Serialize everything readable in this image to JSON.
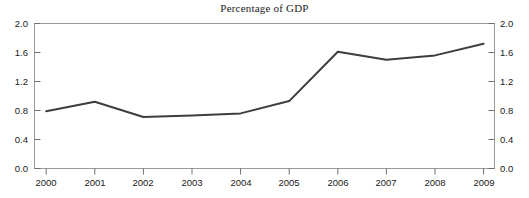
{
  "chart_data": {
    "type": "line",
    "title": "Percentage of GDP",
    "xlabel": "",
    "ylabel": "",
    "categories": [
      "2000",
      "2001",
      "2002",
      "2003",
      "2004",
      "2005",
      "2006",
      "2007",
      "2008",
      "2009"
    ],
    "x": [
      2000,
      2001,
      2002,
      2003,
      2004,
      2005,
      2006,
      2007,
      2008,
      2009
    ],
    "values": [
      0.79,
      0.92,
      0.71,
      0.73,
      0.76,
      0.93,
      1.61,
      1.5,
      1.56,
      1.72
    ],
    "series": [
      {
        "name": "Percentage of GDP",
        "values": [
          0.79,
          0.92,
          0.71,
          0.73,
          0.76,
          0.93,
          1.61,
          1.5,
          1.56,
          1.72
        ]
      }
    ],
    "ylim": [
      0.0,
      2.0
    ],
    "ytick_values": [
      0.0,
      0.4,
      0.8,
      1.2,
      1.6,
      2.0
    ],
    "ytick_labels_left": [
      "0.0",
      "0.4",
      "0.8",
      "1.2",
      "1.6",
      "2.0"
    ],
    "ytick_labels_right": [
      "0.0",
      "0.4",
      "0.8",
      "1.2",
      "1.6",
      "2.0"
    ],
    "xtick_labels": [
      "2000",
      "2001",
      "2002",
      "2003",
      "2004",
      "2005",
      "2006",
      "2007",
      "2008",
      "2009"
    ],
    "grid": false,
    "legend": "none",
    "dual_y_axis": true,
    "line_color": "#3d3d3d",
    "axis_color": "#9a9a9a",
    "background_color": "#ffffff"
  },
  "axes": {
    "y_left": {
      "t0": "0.0",
      "t1": "0.4",
      "t2": "0.8",
      "t3": "1.2",
      "t4": "1.6",
      "t5": "2.0"
    },
    "y_right": {
      "t0": "0.0",
      "t1": "0.4",
      "t2": "0.8",
      "t3": "1.2",
      "t4": "1.6",
      "t5": "2.0"
    },
    "x": {
      "t0": "2000",
      "t1": "2001",
      "t2": "2002",
      "t3": "2003",
      "t4": "2004",
      "t5": "2005",
      "t6": "2006",
      "t7": "2007",
      "t8": "2008",
      "t9": "2009"
    }
  }
}
